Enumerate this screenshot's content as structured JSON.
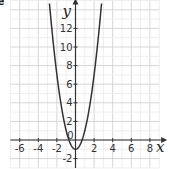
{
  "corner_label": "e",
  "chart_data": {
    "type": "line",
    "title": "",
    "xlabel": "x",
    "ylabel": "y",
    "xlim": [
      -7,
      9
    ],
    "ylim": [
      -3,
      15
    ],
    "grid": true,
    "x_ticks": [
      -6,
      -4,
      -2,
      2,
      4,
      6,
      8
    ],
    "y_ticks": [
      -2,
      2,
      4,
      6,
      8,
      10,
      12
    ],
    "origin_label": "0",
    "series": [
      {
        "name": "parabola",
        "equation": "y = 2x^2 - 1",
        "x": [
          -2.75,
          -2.5,
          -2,
          -1.5,
          -1,
          -0.5,
          0,
          0.5,
          1,
          1.5,
          2,
          2.5,
          2.75
        ],
        "values": [
          14.1,
          11.5,
          7,
          3.5,
          1,
          -0.5,
          -1,
          -0.5,
          1,
          3.5,
          7,
          11.5,
          14.1
        ]
      }
    ],
    "colors": {
      "curve": "#333333",
      "axis": "#333333",
      "grid": "#dddddd"
    }
  }
}
